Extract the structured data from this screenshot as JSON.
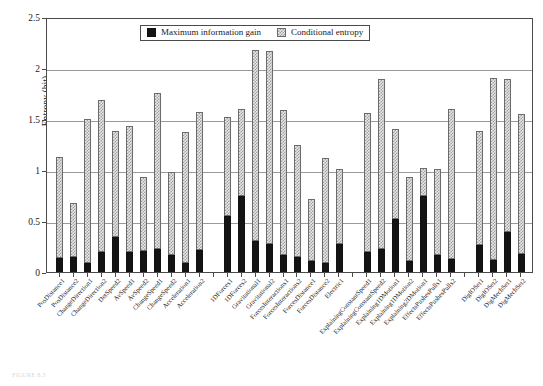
{
  "figure": {
    "caption_remnant": "FIGURE 8.3"
  },
  "legend": {
    "position": "top-center-inside",
    "entries": [
      {
        "label": "Maximum information gain",
        "swatch": "solid-black-square-icon"
      },
      {
        "label": "Conditional entropy",
        "swatch": "dotted-grey-square-icon"
      }
    ]
  },
  "axes": {
    "y_title": "Entropy (bit)",
    "y_ticks": [
      "0",
      "0.5",
      "1",
      "1.5",
      "2",
      "2.5"
    ],
    "y_tick_values": [
      0,
      0.5,
      1,
      1.5,
      2,
      2.5
    ],
    "ylim": [
      0,
      2.5
    ],
    "grid": "horizontal"
  },
  "chart_data": {
    "type": "bar",
    "subtype": "stacked",
    "title": "",
    "xlabel": "",
    "ylabel": "Entropy (bit)",
    "ylim": [
      0,
      2.5
    ],
    "grid": true,
    "legend_position": "top-center",
    "categories": [
      "PosDistance1",
      "PosDistance2",
      "ChangeDirection1",
      "ChangeDirection2",
      "DetSpeed2",
      "AvSpeed1",
      "AvSpeed2",
      "ChangeSpeed1",
      "ChangeSpeed2",
      "Acceleration1",
      "Acceleration2",
      "1DForces1",
      "1DForces2",
      "Gravitational1",
      "Gravitational2",
      "ForcesInteractions1",
      "ForcesInteractions2",
      "ForcesDistance1",
      "ForcesDistance2",
      "Electric1",
      "ExplainingConstantSpeed1",
      "ExplainingConstantSpeed2",
      "Explaining1DMotion1",
      "Explaining1DMotion2",
      "Explaining2DMotion1",
      "EffectsPushesPulls1",
      "EffectsPushesPulls2",
      "DigIOSet1",
      "DigIOSet2",
      "DigMechSet1",
      "DigMechSet2"
    ],
    "group_breaks_after": [
      "Acceleration2",
      "Electric1",
      "EffectsPushesPulls2"
    ],
    "series": [
      {
        "name": "Maximum information gain",
        "color": "#141414",
        "values": [
          0.14,
          0.15,
          0.09,
          0.2,
          0.34,
          0.2,
          0.21,
          0.23,
          0.17,
          0.09,
          0.22,
          0.55,
          0.75,
          0.3,
          0.27,
          0.17,
          0.15,
          0.11,
          0.09,
          0.27,
          0.2,
          0.23,
          0.52,
          0.11,
          0.75,
          0.17,
          0.13,
          0.26,
          0.12,
          0.39,
          0.18
        ]
      },
      {
        "name": "Conditional entropy",
        "color": "#e6e6e6",
        "values": [
          0.99,
          0.53,
          1.41,
          1.49,
          1.04,
          1.23,
          0.72,
          1.53,
          0.81,
          1.28,
          1.35,
          0.97,
          0.85,
          1.88,
          1.9,
          1.42,
          1.1,
          0.61,
          1.03,
          0.74,
          1.36,
          1.66,
          0.88,
          0.82,
          0.27,
          0.84,
          1.47,
          1.12,
          1.78,
          1.5,
          1.37
        ]
      }
    ],
    "totals": [
      1.13,
      0.68,
      1.5,
      1.69,
      1.38,
      1.43,
      0.93,
      1.76,
      0.98,
      1.37,
      1.57,
      1.52,
      1.6,
      2.18,
      2.17,
      1.59,
      1.25,
      0.72,
      1.12,
      1.01,
      1.56,
      1.89,
      1.4,
      0.93,
      1.02,
      1.01,
      1.6,
      1.38,
      1.9,
      1.89,
      1.55
    ]
  }
}
